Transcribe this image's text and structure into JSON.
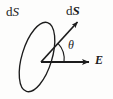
{
  "figure": {
    "kind": "physics-vector-diagram",
    "width": 113,
    "height": 99,
    "background_color": "#fdfdfc",
    "stroke_color": "#1c1c1c",
    "labels": {
      "surface_element_scalar": {
        "prefix": "d",
        "symbol": "S"
      },
      "area_vector": {
        "prefix": "d",
        "symbol": "S"
      },
      "angle": {
        "symbol": "θ"
      },
      "electric_field": {
        "symbol": "E"
      }
    },
    "geometry": {
      "origin": {
        "x": 41,
        "y": 62
      },
      "ellipse": {
        "cx": 37,
        "cy": 57,
        "rx": 15,
        "ry": 36,
        "rotation_deg": 17
      },
      "area_vector_arrow": {
        "x1": 41,
        "y1": 62,
        "x2": 79,
        "y2": 20
      },
      "efield_arrow": {
        "x1": 41,
        "y1": 62,
        "x2": 91,
        "y2": 62
      },
      "angle_arc_radius": 23,
      "leader_line": {
        "x1": 22,
        "y1": 17,
        "x2": 29,
        "y2": 26
      }
    }
  }
}
